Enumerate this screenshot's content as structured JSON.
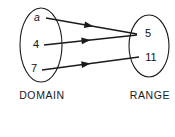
{
  "figure": {
    "type": "mapping-diagram",
    "stroke_color": "#1a1a1a",
    "text_color": "#111111",
    "background_color": "#ffffff"
  },
  "domain": {
    "caption": "DOMAIN",
    "elements": [
      {
        "id": "a",
        "label": "a",
        "italic": true,
        "x": 37,
        "y": 18
      },
      {
        "id": "4",
        "label": "4",
        "italic": false,
        "x": 36,
        "y": 45
      },
      {
        "id": "7",
        "label": "7",
        "italic": false,
        "x": 34,
        "y": 69
      }
    ],
    "oval": {
      "cx": 41,
      "cy": 45,
      "rx": 21,
      "ry": 37
    },
    "caption_x": 42,
    "caption_y": 96
  },
  "range": {
    "caption": "RANGE",
    "elements": [
      {
        "id": "5",
        "label": "5",
        "italic": false,
        "x": 148,
        "y": 34
      },
      {
        "id": "11",
        "label": "11",
        "italic": false,
        "x": 151,
        "y": 58
      }
    ],
    "oval": {
      "cx": 149,
      "cy": 46,
      "rx": 20,
      "ry": 31
    },
    "caption_x": 150,
    "caption_y": 96
  },
  "mappings": [
    {
      "from": "a",
      "to": "5",
      "x1": 46,
      "y1": 18,
      "x2": 137,
      "y2": 34,
      "arrow_t": 0.52
    },
    {
      "from": "4",
      "to": "5",
      "x1": 44,
      "y1": 45,
      "x2": 137,
      "y2": 35,
      "arrow_t": 0.5
    },
    {
      "from": "7",
      "to": "11",
      "x1": 42,
      "y1": 70,
      "x2": 139,
      "y2": 57,
      "arrow_t": 0.5
    }
  ],
  "chart_data": {
    "type": "diagram",
    "title": "",
    "relation": [
      {
        "domain_value": "a",
        "range_value": "5"
      },
      {
        "domain_value": "4",
        "range_value": "5"
      },
      {
        "domain_value": "7",
        "range_value": "11"
      }
    ],
    "domain_set": [
      "a",
      "4",
      "7"
    ],
    "range_set": [
      "5",
      "11"
    ],
    "domain_label": "DOMAIN",
    "range_label": "RANGE"
  }
}
